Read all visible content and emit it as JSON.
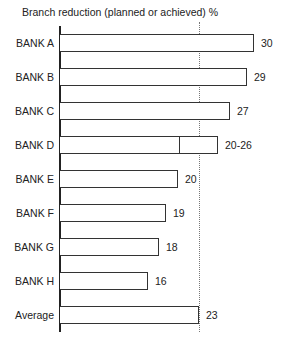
{
  "chart_data": {
    "type": "bar",
    "orientation": "horizontal",
    "title": "Branch reduction (planned or achieved) %",
    "xlabel": "",
    "ylabel": "",
    "categories": [
      "BANK A",
      "BANK B",
      "BANK C",
      "BANK D",
      "BANK E",
      "BANK F",
      "BANK G",
      "BANK H",
      "Average"
    ],
    "values": [
      30,
      29,
      27,
      26,
      20,
      19,
      18,
      16,
      23
    ],
    "value_labels": [
      "30",
      "29",
      "27",
      "20-26",
      "20",
      "19",
      "18",
      "16",
      "23"
    ],
    "ranges": {
      "BANK D": [
        20,
        26
      ]
    },
    "reference_line": {
      "value": 23,
      "style": "dotted",
      "label": "Average"
    },
    "grid": false,
    "legend": null
  },
  "rows": [
    {
      "label": "BANK A",
      "value_label": "30",
      "right": 254,
      "top": 34
    },
    {
      "label": "BANK B",
      "value_label": "29",
      "right": 247,
      "top": 68
    },
    {
      "label": "BANK C",
      "value_label": "27",
      "right": 230,
      "top": 102
    },
    {
      "label": "BANK D",
      "value_label": "20-26",
      "right": 218,
      "split": 179,
      "top": 136
    },
    {
      "label": "BANK E",
      "value_label": "20",
      "right": 178,
      "top": 170
    },
    {
      "label": "BANK F",
      "value_label": "19",
      "right": 166,
      "top": 204
    },
    {
      "label": "BANK G",
      "value_label": "18",
      "right": 159,
      "top": 238
    },
    {
      "label": "BANK H",
      "value_label": "16",
      "right": 148,
      "top": 272
    },
    {
      "label": "Average",
      "value_label": "23",
      "right": 199,
      "top": 306
    }
  ]
}
